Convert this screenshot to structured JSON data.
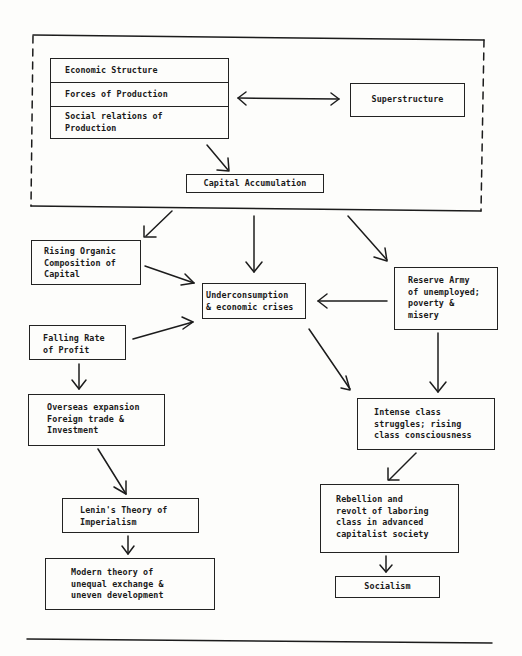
{
  "diagram": {
    "base_group": {
      "economic_structure": {
        "title": "Economic Structure",
        "forces": "Forces of Production",
        "relations": "Social relations of\nProduction"
      },
      "superstructure": "Superstructure",
      "capital_accumulation": "Capital Accumulation"
    },
    "nodes": {
      "rising_organic": "Rising Organic\nComposition of\nCapital",
      "underconsumption": "Underconsumption\n& economic crises",
      "reserve_army": "Reserve Army\nof unemployed;\npoverty &\nmisery",
      "falling_rate": "Falling Rate\nof Profit",
      "overseas": "Overseas expansion\nForeign trade &\nInvestment",
      "lenin": "Lenin's Theory of\nImperialism",
      "modern_theory": "Modern theory of\nunequal exchange &\nuneven development",
      "class_struggle": "Intense class\nstruggles; rising\nclass consciousness",
      "rebellion": "Rebellion and\nrevolt of laboring\nclass in advanced\ncapitalist society",
      "socialism": "Socialism"
    },
    "edges": [
      {
        "from": "economic_structure",
        "to": "superstructure",
        "type": "bidirectional"
      },
      {
        "from": "economic_structure",
        "to": "capital_accumulation"
      },
      {
        "from": "base_group",
        "to": "rising_organic"
      },
      {
        "from": "base_group",
        "to": "underconsumption"
      },
      {
        "from": "base_group",
        "to": "reserve_army"
      },
      {
        "from": "rising_organic",
        "to": "underconsumption"
      },
      {
        "from": "falling_rate",
        "to": "underconsumption"
      },
      {
        "from": "reserve_army",
        "to": "underconsumption"
      },
      {
        "from": "falling_rate",
        "to": "overseas"
      },
      {
        "from": "overseas",
        "to": "lenin"
      },
      {
        "from": "lenin",
        "to": "modern_theory"
      },
      {
        "from": "underconsumption",
        "to": "class_struggle"
      },
      {
        "from": "reserve_army",
        "to": "class_struggle"
      },
      {
        "from": "class_struggle",
        "to": "rebellion"
      },
      {
        "from": "rebellion",
        "to": "socialism"
      }
    ]
  }
}
